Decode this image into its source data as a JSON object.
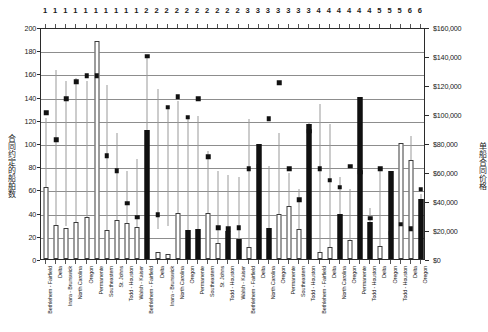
{
  "chart_data": {
    "type": "bar",
    "title": "",
    "subtitle": "",
    "xlabel": "",
    "ylabel": "合同约定的船舶数",
    "ylabel_right": "单船合同价格",
    "grid": true,
    "legend_position": "none",
    "y_left": {
      "min": 0,
      "max": 200,
      "step": 20,
      "ticks": [
        "0",
        "20",
        "40",
        "60",
        "80",
        "100",
        "120",
        "140",
        "160",
        "180",
        "200"
      ]
    },
    "y_right": {
      "min": 0,
      "max": 160000,
      "step": 20000,
      "ticks": [
        "$0",
        "$20,000",
        "$40,000",
        "$60,000",
        "$80,000",
        "$100,000",
        "$120,000",
        "$140,000",
        "$160,000"
      ]
    },
    "group_numbers": [
      "1",
      "1",
      "1",
      "1",
      "1",
      "1",
      "1",
      "1",
      "1",
      "1",
      "2",
      "2",
      "2",
      "2",
      "2",
      "2",
      "2",
      "2",
      "2",
      "2",
      "3",
      "3",
      "3",
      "3",
      "3",
      "3",
      "3",
      "4",
      "4",
      "4",
      "4",
      "4",
      "4",
      "5",
      "5",
      "5",
      "6",
      "6"
    ],
    "categories": [
      "Bethlehem - Fairfield",
      "Delta",
      "Inara - Brunswick",
      "North Carolina",
      "Oregon",
      "Permanente",
      "Southeastern",
      "St. Johns",
      "Todd - Houston",
      "Walsh - Kaiser",
      "Bethlehem - Fairfield",
      "Delta",
      "Inara - Brunswick",
      "North Carolina",
      "Oregon",
      "Permanente",
      "Southeastern",
      "St. Johns",
      "Todd - Houston",
      "Walsh - Kaiser",
      "Bethlehem - Fairfield",
      "Delta",
      "North Carolina",
      "Oregon",
      "Permanente",
      "Southeastern",
      "Todd - Houston",
      "Bethlehem - Fairfield",
      "Delta",
      "North Carolina",
      "Oregon",
      "Permanente",
      "Todd - Houston",
      "Delta",
      "Oregon",
      "Todd - Houston",
      "Delta",
      "Oregon"
    ],
    "series": [
      {
        "name": "合同约定的船舶数",
        "axis": "left",
        "style": "bar",
        "values": [
          62,
          29,
          27,
          32,
          36,
          188,
          25,
          34,
          31,
          28,
          111,
          6,
          4,
          40,
          25,
          26,
          40,
          14,
          24,
          17,
          10,
          99,
          27,
          39,
          46,
          26,
          116,
          6,
          10,
          39,
          16,
          140,
          32,
          11,
          76,
          100,
          85,
          52
        ],
        "fill": [
          "open",
          "open",
          "open",
          "open",
          "open",
          "open",
          "open",
          "open",
          "open",
          "open",
          "filled",
          "open",
          "open",
          "open",
          "filled",
          "filled",
          "open",
          "open",
          "filled",
          "filled",
          "open",
          "filled",
          "filled",
          "open",
          "open",
          "open",
          "filled",
          "open",
          "open",
          "filled",
          "open",
          "filled",
          "filled",
          "open",
          "filled",
          "open",
          "open",
          "filled"
        ]
      },
      {
        "name": "单船合同价格",
        "axis": "right",
        "style": "marker",
        "values": [
          100800,
          82400,
          110400,
          122400,
          126400,
          126400,
          71200,
          60800,
          38400,
          28800,
          140000,
          30400,
          104800,
          112000,
          97600,
          110400,
          70400,
          21600,
          20800,
          21600,
          62400,
          64000,
          96800,
          121600,
          62400,
          40800,
          88000,
          62400,
          54400,
          49600,
          64000,
          60000,
          28000,
          62400,
          17600,
          24000,
          20800,
          48000
        ]
      }
    ],
    "whisker_ranges": [
      [
        24,
        123
      ],
      [
        28,
        165
      ],
      [
        30,
        155
      ],
      [
        30,
        158
      ],
      [
        34,
        155
      ],
      [
        36,
        190
      ],
      [
        24,
        152
      ],
      [
        34,
        110
      ],
      [
        30,
        78
      ],
      [
        26,
        88
      ],
      [
        10,
        175
      ],
      [
        28,
        148
      ],
      [
        30,
        133
      ],
      [
        38,
        138
      ],
      [
        22,
        122
      ],
      [
        24,
        125
      ],
      [
        38,
        95
      ],
      [
        12,
        78
      ],
      [
        22,
        74
      ],
      [
        16,
        72
      ],
      [
        10,
        122
      ],
      [
        24,
        97
      ],
      [
        24,
        82
      ],
      [
        36,
        110
      ],
      [
        42,
        76
      ],
      [
        24,
        62
      ],
      [
        30,
        120
      ],
      [
        6,
        135
      ],
      [
        10,
        118
      ],
      [
        36,
        72
      ],
      [
        14,
        62
      ],
      [
        38,
        70
      ],
      [
        30,
        46
      ],
      [
        10,
        80
      ],
      [
        22,
        72
      ],
      [
        30,
        102
      ],
      [
        22,
        108
      ],
      [
        20,
        58
      ]
    ]
  }
}
